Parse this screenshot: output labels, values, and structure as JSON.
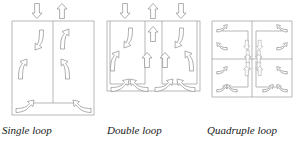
{
  "figure": {
    "background_color": "#ffffff",
    "line_color": "#9a9a9a",
    "arrow_outline_color": "#8d8d8d",
    "arrow_fill_color": "#ffffff",
    "caption_color": "#1a1a1a",
    "width": 298,
    "height": 146
  },
  "panels": [
    {
      "id": "single-loop",
      "caption": "Single loop",
      "cells": 1,
      "box": {
        "x": 12,
        "y": 21,
        "w": 82,
        "h": 94
      },
      "vertical_dividers": 1,
      "horizontal_dividers": 1,
      "external_arrows": [
        {
          "name": "inflow-down",
          "direction": "down",
          "x": 37,
          "y": 5
        },
        {
          "name": "outflow-up",
          "direction": "up",
          "x": 62,
          "y": 5
        }
      ],
      "internal_arrows": [
        {
          "name": "descending-left",
          "direction": "down",
          "style": "curved"
        },
        {
          "name": "ascending-right",
          "direction": "up",
          "style": "curved"
        },
        {
          "name": "upwelling-left",
          "direction": "up",
          "style": "curved"
        },
        {
          "name": "return-right",
          "direction": "up",
          "style": "elbow"
        },
        {
          "name": "floor-left",
          "direction": "right",
          "style": "elbow"
        },
        {
          "name": "floor-right",
          "direction": "up",
          "style": "elbow"
        }
      ]
    },
    {
      "id": "double-loop",
      "caption": "Double loop",
      "cells": 2,
      "box": {
        "x": 107,
        "y": 21,
        "w": 93,
        "h": 70
      },
      "vertical_dividers": 2,
      "horizontal_dividers": 1,
      "external_arrows": [
        {
          "name": "inflow-down-left",
          "direction": "down",
          "x": 124,
          "y": 5
        },
        {
          "name": "outflow-up-center",
          "direction": "up",
          "x": 152,
          "y": 5
        },
        {
          "name": "inflow-down-right",
          "direction": "down",
          "x": 180,
          "y": 5
        }
      ],
      "internal_arrows": [
        {
          "name": "descending-left",
          "direction": "down",
          "style": "curved"
        },
        {
          "name": "ascending-center-top",
          "direction": "up",
          "style": "straight"
        },
        {
          "name": "descending-right",
          "direction": "down",
          "style": "curved"
        },
        {
          "name": "upwelling-far-left",
          "direction": "up",
          "style": "curved"
        },
        {
          "name": "ascending-center-left",
          "direction": "up",
          "style": "straight"
        },
        {
          "name": "ascending-center-right",
          "direction": "up",
          "style": "straight"
        },
        {
          "name": "upwelling-far-right",
          "direction": "down",
          "style": "curved"
        },
        {
          "name": "floor-left",
          "direction": "right",
          "style": "elbow"
        },
        {
          "name": "floor-center-left",
          "direction": "left",
          "style": "elbow"
        },
        {
          "name": "floor-center-right",
          "direction": "right",
          "style": "elbow"
        },
        {
          "name": "floor-right",
          "direction": "left",
          "style": "elbow"
        }
      ]
    },
    {
      "id": "quadruple-loop",
      "caption": "Quadruple loop",
      "cells": 4,
      "box": {
        "x": 212,
        "y": 21,
        "w": 80,
        "h": 76
      },
      "vertical_dividers": 1,
      "horizontal_dividers": 1,
      "grid": "2x2",
      "external_arrows": [],
      "internal_arrows": [
        {
          "name": "q1-corner",
          "direction": "right",
          "style": "elbow"
        },
        {
          "name": "q1-side",
          "direction": "left",
          "style": "elbow"
        },
        {
          "name": "q1-center",
          "direction": "down",
          "style": "straight"
        },
        {
          "name": "q2-corner",
          "direction": "left",
          "style": "elbow"
        },
        {
          "name": "q2-side",
          "direction": "right",
          "style": "elbow"
        },
        {
          "name": "q2-center",
          "direction": "down",
          "style": "straight"
        },
        {
          "name": "q3-corner",
          "direction": "up",
          "style": "elbow"
        },
        {
          "name": "q3-side",
          "direction": "right",
          "style": "elbow"
        },
        {
          "name": "q3-center",
          "direction": "up",
          "style": "straight"
        },
        {
          "name": "q4-corner",
          "direction": "up",
          "style": "elbow"
        },
        {
          "name": "q4-side",
          "direction": "left",
          "style": "elbow"
        },
        {
          "name": "q4-center",
          "direction": "up",
          "style": "straight"
        }
      ]
    }
  ]
}
